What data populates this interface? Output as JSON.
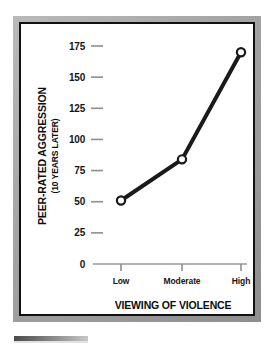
{
  "figure": {
    "frame_color": "#a2a2a2",
    "inner_border_color": "#111111",
    "background": "#ffffff"
  },
  "chart_data": {
    "type": "line",
    "title": "",
    "subtitle": "",
    "xlabel": "VIEWING OF VIOLENCE",
    "xlabel_line2": "IN CHILDHOOD",
    "ylabel": "PEER-RATED AGGRESSION",
    "ylabel_line2": "(10 YEARS LATER)",
    "categories": [
      "Low",
      "Moderate",
      "High"
    ],
    "values": [
      51,
      84,
      170
    ],
    "series": [
      {
        "name": "Peer-rated aggression",
        "values": [
          51,
          84,
          170
        ],
        "color": "#1a1a1a",
        "marker": "open-circle",
        "line_width": 4
      }
    ],
    "ylim": [
      0,
      175
    ],
    "ytick_values": [
      0,
      25,
      50,
      75,
      100,
      125,
      150,
      175
    ],
    "ytick_labels": [
      "0",
      "25",
      "50",
      "75",
      "100",
      "125",
      "150",
      "175"
    ],
    "xtick_labels": [
      "Low",
      "Moderate",
      "High"
    ],
    "grid": false,
    "legend": false,
    "legend_position": "none",
    "axis_color": "#9a9a9a",
    "tick_color": "#8f8f8f",
    "text_color": "#141414"
  },
  "caption": {
    "rule_color": "#8d8d8d"
  }
}
